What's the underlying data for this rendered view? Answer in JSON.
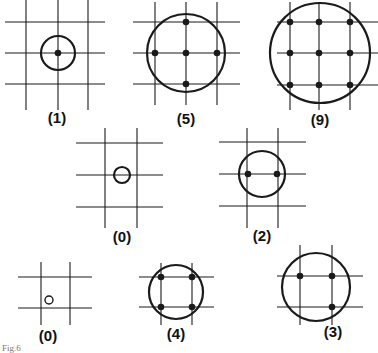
{
  "figure_caption": "Fig.6",
  "colors": {
    "line": "#1a1a1a",
    "background": "#ffffff"
  },
  "panels": [
    {
      "id": "panel-1",
      "label": "(1)",
      "count": 1,
      "verticals": [
        26,
        58,
        88
      ],
      "v_span": [
        0,
        110
      ],
      "horizontals": [
        22,
        53,
        84
      ],
      "h_span": [
        5,
        105
      ],
      "circle": {
        "cx": 58,
        "cy": 53,
        "r": 17,
        "filled": false
      },
      "dots": [
        [
          58,
          53
        ]
      ],
      "label_pos": [
        57,
        123
      ]
    },
    {
      "id": "panel-5",
      "label": "(5)",
      "count": 5,
      "verticals": [
        155,
        186,
        217
      ],
      "v_span": [
        2,
        105
      ],
      "horizontals": [
        22,
        53,
        84
      ],
      "h_span": [
        133,
        240
      ],
      "circle": {
        "cx": 186,
        "cy": 53,
        "r": 39,
        "filled": false
      },
      "dots": [
        [
          186,
          22
        ],
        [
          155,
          53
        ],
        [
          186,
          53
        ],
        [
          217,
          53
        ],
        [
          186,
          84
        ]
      ],
      "label_pos": [
        186,
        124
      ]
    },
    {
      "id": "panel-9",
      "label": "(9)",
      "count": 9,
      "verticals": [
        290,
        319,
        350
      ],
      "v_span": [
        2,
        110
      ],
      "horizontals": [
        22,
        53,
        85
      ],
      "h_span": [
        277,
        378
      ],
      "circle": {
        "cx": 320,
        "cy": 53,
        "r": 50,
        "filled": false
      },
      "dots": [
        [
          290,
          22
        ],
        [
          319,
          22
        ],
        [
          350,
          22
        ],
        [
          290,
          53
        ],
        [
          319,
          53
        ],
        [
          350,
          53
        ],
        [
          290,
          85
        ],
        [
          319,
          85
        ],
        [
          350,
          85
        ]
      ],
      "label_pos": [
        320,
        125
      ]
    },
    {
      "id": "panel-0-middle",
      "label": "(0)",
      "count": 0,
      "verticals": [
        105,
        137
      ],
      "v_span": [
        128,
        228
      ],
      "horizontals": [
        143,
        175,
        207
      ],
      "h_span": [
        76,
        163
      ],
      "circle": {
        "cx": 122,
        "cy": 175,
        "r": 8,
        "filled": false
      },
      "dots": [],
      "label_pos": [
        122,
        242
      ]
    },
    {
      "id": "panel-2",
      "label": "(2)",
      "count": 2,
      "verticals": [
        247,
        278
      ],
      "v_span": [
        128,
        228
      ],
      "horizontals": [
        142,
        174,
        206
      ],
      "h_span": [
        219,
        306
      ],
      "circle": {
        "cx": 262,
        "cy": 174,
        "r": 23,
        "filled": false
      },
      "dots": [
        [
          248,
          174
        ],
        [
          277,
          174
        ]
      ],
      "label_pos": [
        262,
        241
      ]
    },
    {
      "id": "panel-0-bottom",
      "label": "(0)",
      "count": 0,
      "verticals": [
        41,
        70
      ],
      "v_span": [
        262,
        325
      ],
      "horizontals": [
        277,
        308
      ],
      "h_span": [
        18,
        92
      ],
      "circle": {
        "cx": 49,
        "cy": 300,
        "r": 4,
        "filled": false
      },
      "dots": [],
      "label_pos": [
        48,
        341
      ]
    },
    {
      "id": "panel-4",
      "label": "(4)",
      "count": 4,
      "verticals": [
        161,
        192
      ],
      "v_span": [
        263,
        325
      ],
      "horizontals": [
        277,
        307
      ],
      "h_span": [
        139,
        214
      ],
      "circle": {
        "cx": 176,
        "cy": 292,
        "r": 27,
        "filled": false
      },
      "dots": [
        [
          161,
          277
        ],
        [
          192,
          277
        ],
        [
          161,
          307
        ],
        [
          192,
          307
        ]
      ],
      "label_pos": [
        176,
        339
      ]
    },
    {
      "id": "panel-3",
      "label": "(3)",
      "count": 3,
      "verticals": [
        300,
        332
      ],
      "v_span": [
        245,
        325
      ],
      "horizontals": [
        276,
        307
      ],
      "h_span": [
        277,
        363
      ],
      "circle": {
        "cx": 316,
        "cy": 287,
        "r": 34,
        "filled": false
      },
      "dots": [
        [
          300,
          276
        ],
        [
          332,
          276
        ],
        [
          332,
          307
        ]
      ],
      "label_pos": [
        333,
        337
      ]
    }
  ]
}
